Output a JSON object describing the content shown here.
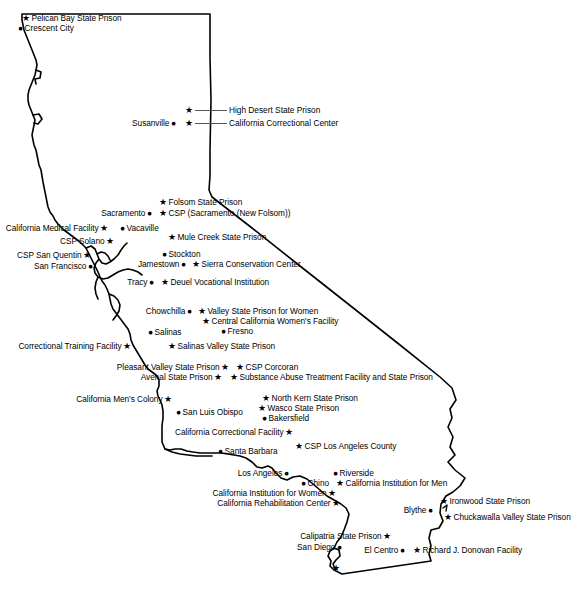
{
  "map": {
    "title": "California State Prisons Map",
    "region": "California",
    "outline_color": "#000000",
    "marker_colors": {
      "prison": "#000000",
      "city": "#000000"
    },
    "glyphs": {
      "prison": "★",
      "city": "●"
    },
    "leader_line_color": "#555555"
  },
  "prisons": [
    {
      "name": "Pelican Bay State Prison",
      "x": 26,
      "y": 19,
      "side": "right"
    },
    {
      "name": "High Desert State Prison",
      "x": 188,
      "y": 111,
      "side": "leader"
    },
    {
      "name": "California Correctional Center",
      "x": 188,
      "y": 124,
      "side": "leader"
    },
    {
      "name": "Folsom State Prison",
      "x": 163,
      "y": 203,
      "side": "right"
    },
    {
      "name": "CSP (Sacramento (New Folsom))",
      "x": 163,
      "y": 214,
      "side": "right"
    },
    {
      "name": "California Medical Facility",
      "x": 112,
      "y": 229,
      "side": "left"
    },
    {
      "name": "Mule Creek State Prison",
      "x": 172,
      "y": 238,
      "side": "right"
    },
    {
      "name": "CSP Solano",
      "x": 118,
      "y": 242,
      "side": "left"
    },
    {
      "name": "CSP San Quentin",
      "x": 95,
      "y": 256,
      "side": "left"
    },
    {
      "name": "Sierra Conservation Center",
      "x": 196,
      "y": 265,
      "side": "right"
    },
    {
      "name": "Deuel Vocational Institution",
      "x": 165,
      "y": 283,
      "side": "right"
    },
    {
      "name": "Valley State Prison for Women",
      "x": 202,
      "y": 312,
      "side": "right"
    },
    {
      "name": "Central California Women's Facility",
      "x": 206,
      "y": 322,
      "side": "right"
    },
    {
      "name": "Correctional Training Facility",
      "x": 135,
      "y": 347,
      "side": "left"
    },
    {
      "name": "Salinas Valley State Prison",
      "x": 172,
      "y": 347,
      "side": "right"
    },
    {
      "name": "Pleasant Valley State Prison",
      "x": 233,
      "y": 368,
      "side": "left"
    },
    {
      "name": "CSP Corcoran",
      "x": 240,
      "y": 368,
      "side": "right"
    },
    {
      "name": "Avenal State Prison",
      "x": 226,
      "y": 378,
      "side": "left"
    },
    {
      "name": "Substance Abuse Treatment Facility and State Prison",
      "x": 234,
      "y": 378,
      "side": "right"
    },
    {
      "name": "California Men's Colony",
      "x": 176,
      "y": 400,
      "side": "left"
    },
    {
      "name": "North Kern State Prison",
      "x": 266,
      "y": 399,
      "side": "right"
    },
    {
      "name": "Wasco State Prison",
      "x": 262,
      "y": 409,
      "side": "right"
    },
    {
      "name": "California Correctional Facility",
      "x": 297,
      "y": 433,
      "side": "left"
    },
    {
      "name": "CSP Los Angeles County",
      "x": 299,
      "y": 447,
      "side": "right"
    },
    {
      "name": "California Institution for Men",
      "x": 340,
      "y": 484,
      "side": "right"
    },
    {
      "name": "California Institution for Women",
      "x": 340,
      "y": 494,
      "side": "left"
    },
    {
      "name": "California Rehabilitation Center",
      "x": 344,
      "y": 504,
      "side": "left"
    },
    {
      "name": "Ironwood State Prison",
      "x": 444,
      "y": 502,
      "side": "right"
    },
    {
      "name": "Chuckawalla Valley State Prison",
      "x": 448,
      "y": 518,
      "side": "right"
    },
    {
      "name": "Calipatria State Prison",
      "x": 395,
      "y": 537,
      "side": "left"
    },
    {
      "name": "Centinela State Prison",
      "x": 417,
      "y": 551,
      "side": "right"
    },
    {
      "name": "Richard J. Donovan Facility",
      "x": 344,
      "y": 569,
      "side": "left"
    }
  ],
  "cities": [
    {
      "name": "Crescent City",
      "x": 22,
      "y": 29,
      "side": "right"
    },
    {
      "name": "Susanville",
      "x": 180,
      "y": 124,
      "side": "left"
    },
    {
      "name": "Sacramento",
      "x": 156,
      "y": 214,
      "side": "left"
    },
    {
      "name": "Vacaville",
      "x": 124,
      "y": 229,
      "side": "right"
    },
    {
      "name": "Stockton",
      "x": 166,
      "y": 255,
      "side": "right"
    },
    {
      "name": "San Francisco",
      "x": 97,
      "y": 267,
      "side": "left"
    },
    {
      "name": "Jamestown",
      "x": 190,
      "y": 265,
      "side": "left"
    },
    {
      "name": "Tracy",
      "x": 158,
      "y": 283,
      "side": "left"
    },
    {
      "name": "Chowchilla",
      "x": 196,
      "y": 312,
      "side": "left"
    },
    {
      "name": "Salinas",
      "x": 152,
      "y": 333,
      "side": "right"
    },
    {
      "name": "Fresno",
      "x": 225,
      "y": 332,
      "side": "right"
    },
    {
      "name": "San Luis Obispo",
      "x": 180,
      "y": 413,
      "side": "right"
    },
    {
      "name": "Bakersfield",
      "x": 266,
      "y": 419,
      "side": "right"
    },
    {
      "name": "Santa Barbara",
      "x": 222,
      "y": 452,
      "side": "right"
    },
    {
      "name": "Los Angeles",
      "x": 293,
      "y": 474,
      "side": "left"
    },
    {
      "name": "Riverside",
      "x": 337,
      "y": 474,
      "side": "right"
    },
    {
      "name": "Chino",
      "x": 305,
      "y": 484,
      "side": "right"
    },
    {
      "name": "Blythe",
      "x": 437,
      "y": 511,
      "side": "left"
    },
    {
      "name": "San Diego",
      "x": 346,
      "y": 548,
      "side": "left"
    },
    {
      "name": "El Centro",
      "x": 409,
      "y": 551,
      "side": "left"
    }
  ]
}
